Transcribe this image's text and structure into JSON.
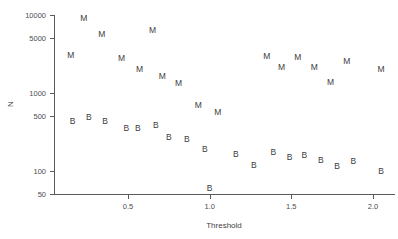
{
  "chart_data": {
    "type": "scatter",
    "title": "",
    "xlabel": "Threshold",
    "ylabel": "N",
    "yscale": "log",
    "xlim": [
      0.08,
      2.1
    ],
    "ylim": [
      45,
      12500
    ],
    "grid": false,
    "legend_position": "none",
    "xticks": [
      0.5,
      1.0,
      1.5,
      2.0
    ],
    "xtick_labels": [
      "0.5",
      "1.0",
      "1.5",
      "2.0"
    ],
    "yticks": [
      50,
      100,
      500,
      1000,
      5000,
      10000
    ],
    "ytick_labels": [
      "50",
      "100",
      "500",
      "1000",
      "5000",
      "10000"
    ],
    "series": [
      {
        "name": "M",
        "marker": "M",
        "points": [
          {
            "x": 0.23,
            "y": 9000
          },
          {
            "x": 0.34,
            "y": 5600
          },
          {
            "x": 0.65,
            "y": 6300
          },
          {
            "x": 0.15,
            "y": 3000
          },
          {
            "x": 0.46,
            "y": 2700
          },
          {
            "x": 0.57,
            "y": 2000
          },
          {
            "x": 0.71,
            "y": 1600
          },
          {
            "x": 0.81,
            "y": 1300
          },
          {
            "x": 1.35,
            "y": 2900
          },
          {
            "x": 1.54,
            "y": 2800
          },
          {
            "x": 1.84,
            "y": 2500
          },
          {
            "x": 1.44,
            "y": 2100
          },
          {
            "x": 1.64,
            "y": 2100
          },
          {
            "x": 2.05,
            "y": 2000
          },
          {
            "x": 1.74,
            "y": 1350
          },
          {
            "x": 0.93,
            "y": 680
          },
          {
            "x": 1.05,
            "y": 560
          }
        ]
      },
      {
        "name": "B",
        "marker": "B",
        "points": [
          {
            "x": 0.16,
            "y": 420
          },
          {
            "x": 0.26,
            "y": 480
          },
          {
            "x": 0.36,
            "y": 420
          },
          {
            "x": 0.49,
            "y": 340
          },
          {
            "x": 0.56,
            "y": 340
          },
          {
            "x": 0.67,
            "y": 380
          },
          {
            "x": 0.75,
            "y": 265
          },
          {
            "x": 0.86,
            "y": 250
          },
          {
            "x": 0.97,
            "y": 185
          },
          {
            "x": 1.16,
            "y": 160
          },
          {
            "x": 1.27,
            "y": 115
          },
          {
            "x": 1.39,
            "y": 170
          },
          {
            "x": 1.49,
            "y": 148
          },
          {
            "x": 1.58,
            "y": 155
          },
          {
            "x": 1.68,
            "y": 135
          },
          {
            "x": 1.78,
            "y": 112
          },
          {
            "x": 1.88,
            "y": 128
          },
          {
            "x": 2.05,
            "y": 98
          },
          {
            "x": 1.0,
            "y": 58
          }
        ]
      }
    ]
  }
}
